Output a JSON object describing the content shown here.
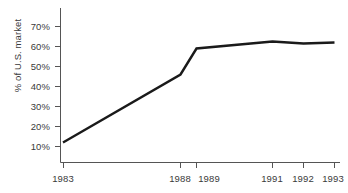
{
  "chart_data": {
    "type": "line",
    "title": "",
    "subtitle": "",
    "xlabel": "",
    "ylabel": "% of U.S. market",
    "x": [
      1983,
      1988,
      1989,
      1991,
      1992,
      1993
    ],
    "xtick_labels": [
      "1983",
      "1988",
      "1989",
      "1991",
      "1992",
      "1993"
    ],
    "values": [
      12,
      46,
      59,
      62.5,
      61.5,
      62
    ],
    "series": [
      {
        "name": "% of U.S. market",
        "values": [
          12,
          46,
          59,
          62.5,
          61.5,
          62
        ]
      }
    ],
    "ylim": [
      0,
      75
    ],
    "ytick_values": [
      10,
      20,
      30,
      40,
      50,
      60,
      70
    ],
    "ytick_labels": [
      "10%",
      "20%",
      "30%",
      "40%",
      "50%",
      "60%",
      "70%"
    ],
    "xlim": [
      1983,
      1993
    ],
    "grid": false,
    "legend": false,
    "legend_position": "none",
    "line_color": "#1a1a1a",
    "axis_color": "#555555",
    "text_color": "#3a3a3a",
    "background_color": "#ffffff"
  }
}
